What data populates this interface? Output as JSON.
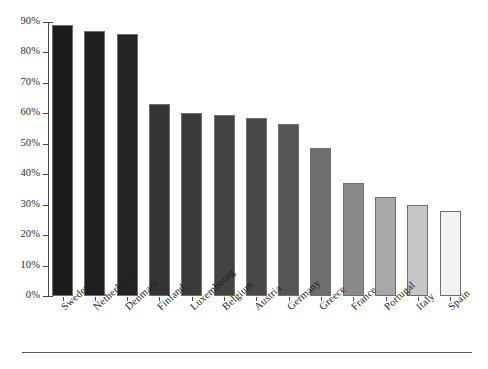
{
  "chart_data": {
    "type": "bar",
    "title": "",
    "subtitle": "",
    "xlabel": "",
    "ylabel": "",
    "categories": [
      "Sweden",
      "Netherlands",
      "Denmark",
      "Finland",
      "Luxembourg",
      "Belgium",
      "Austria",
      "Germany",
      "Greece",
      "France",
      "Portugal",
      "Italy",
      "Spain"
    ],
    "values": [
      89,
      87,
      86,
      63,
      60,
      59.5,
      58.5,
      56.5,
      48.5,
      37,
      32.5,
      30,
      28
    ],
    "value_labels": [
      "89%",
      "87%",
      "86%",
      "63%",
      "60%",
      "59.5%",
      "58.5%",
      "56.5%",
      "48.5%",
      "37%",
      "32.5%",
      "30%",
      "28%"
    ],
    "bar_colors": [
      "#1c1c1c",
      "#1f1f1f",
      "#242424",
      "#343434",
      "#3b3b3b",
      "#434343",
      "#484848",
      "#555555",
      "#6e6e6e",
      "#8a8a8a",
      "#a8a8a8",
      "#c6c6c6",
      "#f2f2f2"
    ],
    "bar_border_color": "#6e6e6e",
    "ylim": [
      0,
      90
    ],
    "ytick_values": [
      0,
      10,
      20,
      30,
      40,
      50,
      60,
      70,
      80,
      90
    ],
    "ytick_labels": [
      "0%",
      "10%",
      "20%",
      "30%",
      "40%",
      "50%",
      "60%",
      "70%",
      "80%",
      "90%"
    ],
    "grid": false,
    "legend": false,
    "legend_position": "none",
    "axis_color": "#4a4a4a",
    "background_color": "#ffffff"
  },
  "figure": {
    "footer_rule_visible": true
  }
}
